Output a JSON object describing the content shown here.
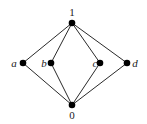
{
  "diagram": {
    "type": "hasse-diagram",
    "nodes": {
      "top": {
        "label": "1",
        "x": 72,
        "y": 23
      },
      "a": {
        "label": "a",
        "x": 23,
        "y": 63
      },
      "b": {
        "label": "b",
        "x": 51,
        "y": 63
      },
      "c": {
        "label": "c",
        "x": 100,
        "y": 63
      },
      "d": {
        "label": "d",
        "x": 127,
        "y": 63
      },
      "bottom": {
        "label": "0",
        "x": 72,
        "y": 105
      }
    },
    "edges": [
      [
        "top",
        "a"
      ],
      [
        "top",
        "b"
      ],
      [
        "top",
        "c"
      ],
      [
        "top",
        "d"
      ],
      [
        "a",
        "bottom"
      ],
      [
        "b",
        "bottom"
      ],
      [
        "c",
        "bottom"
      ],
      [
        "d",
        "bottom"
      ]
    ],
    "colors": {
      "node": "#000000",
      "edge": "#2a2a2a",
      "background": "#ffffff"
    }
  }
}
